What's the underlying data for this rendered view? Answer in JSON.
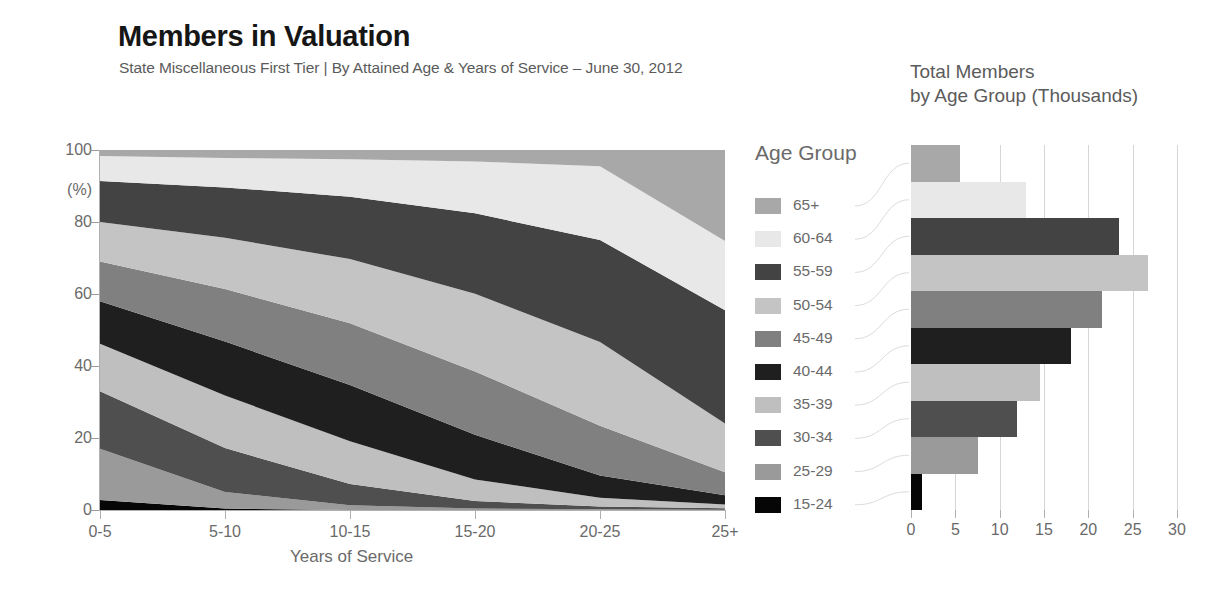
{
  "header": {
    "title": "Members in Valuation",
    "subtitle": "State Miscellaneous First Tier | By Attained Age & Years of Service – June 30, 2012",
    "right_title_line1": "Total Members",
    "right_title_line2": "by Age Group (Thousands)"
  },
  "legend": {
    "title": "Age Group",
    "items": [
      {
        "label": "65+",
        "color": "#a8a8a8"
      },
      {
        "label": "60-64",
        "color": "#e8e8e8"
      },
      {
        "label": "55-59",
        "color": "#434343"
      },
      {
        "label": "50-54",
        "color": "#c4c4c4"
      },
      {
        "label": "45-49",
        "color": "#808080"
      },
      {
        "label": "40-44",
        "color": "#1f1f1f"
      },
      {
        "label": "35-39",
        "color": "#bfbfbf"
      },
      {
        "label": "30-34",
        "color": "#4f4f4f"
      },
      {
        "label": "25-29",
        "color": "#9a9a9a"
      },
      {
        "label": "15-24",
        "color": "#060606"
      }
    ]
  },
  "chart_data": [
    {
      "type": "area",
      "id": "members-by-service-area",
      "title": "Members in Valuation",
      "subtitle": "State Miscellaneous First Tier | By Attained Age & Years of Service – June 30, 2012",
      "stacked": true,
      "normalized_percent": true,
      "xlabel": "Years of Service",
      "ylabel": "(%)",
      "ylim": [
        0,
        100
      ],
      "yticks": [
        0,
        20,
        40,
        60,
        80,
        100
      ],
      "grid": false,
      "legend_position": "right",
      "categories": [
        "0-5",
        "5-10",
        "10-15",
        "15-20",
        "20-25",
        "25+"
      ],
      "series": [
        {
          "name": "15-24",
          "color": "#060606",
          "values": [
            2.8,
            0.4,
            0.0,
            0.0,
            0.0,
            0.0
          ]
        },
        {
          "name": "25-29",
          "color": "#9a9a9a",
          "values": [
            14.2,
            4.6,
            1.3,
            0.4,
            0.2,
            0.1
          ]
        },
        {
          "name": "30-34",
          "color": "#4f4f4f",
          "values": [
            16.0,
            12.2,
            5.9,
            2.1,
            0.8,
            0.4
          ]
        },
        {
          "name": "35-39",
          "color": "#bfbfbf",
          "values": [
            13.2,
            14.6,
            11.9,
            6.0,
            2.4,
            1.0
          ]
        },
        {
          "name": "40-44",
          "color": "#1f1f1f",
          "values": [
            11.8,
            15.0,
            15.6,
            12.4,
            6.2,
            2.6
          ]
        },
        {
          "name": "45-49",
          "color": "#808080",
          "values": [
            11.0,
            14.6,
            17.2,
            17.6,
            13.8,
            6.4
          ]
        },
        {
          "name": "50-54",
          "color": "#c4c4c4",
          "values": [
            11.0,
            14.2,
            17.8,
            21.6,
            23.3,
            13.5
          ]
        },
        {
          "name": "55-59",
          "color": "#434343",
          "values": [
            11.4,
            14.0,
            17.3,
            22.3,
            28.3,
            31.5
          ]
        },
        {
          "name": "60-64",
          "color": "#e8e8e8",
          "values": [
            6.9,
            8.2,
            10.4,
            14.4,
            20.5,
            19.2
          ]
        },
        {
          "name": "65+",
          "color": "#a8a8a8",
          "values": [
            1.7,
            2.2,
            2.6,
            3.2,
            4.5,
            25.3
          ]
        }
      ]
    },
    {
      "type": "bar",
      "id": "total-members-by-age-group",
      "orientation": "horizontal",
      "title": "Total Members by Age Group (Thousands)",
      "xlabel": "",
      "ylabel": "",
      "xlim": [
        0,
        30
      ],
      "xticks": [
        0,
        5,
        10,
        15,
        20,
        25,
        30
      ],
      "grid": true,
      "categories": [
        "65+",
        "60-64",
        "55-59",
        "50-54",
        "45-49",
        "40-44",
        "35-39",
        "30-34",
        "25-29",
        "15-24"
      ],
      "values": [
        5.5,
        13.0,
        23.5,
        26.7,
        21.5,
        18.0,
        14.5,
        12.0,
        7.5,
        1.2
      ],
      "colors": [
        "#a8a8a8",
        "#e8e8e8",
        "#434343",
        "#c4c4c4",
        "#808080",
        "#1f1f1f",
        "#bfbfbf",
        "#4f4f4f",
        "#9a9a9a",
        "#060606"
      ]
    }
  ],
  "axes": {
    "area_y_ticks": [
      "0",
      "20",
      "40",
      "60",
      "80",
      "100"
    ],
    "area_y_unit": "(%)",
    "area_x_ticks": [
      "0-5",
      "5-10",
      "10-15",
      "15-20",
      "20-25",
      "25+"
    ],
    "area_x_title": "Years of Service",
    "bar_x_ticks": [
      "0",
      "5",
      "10",
      "15",
      "20",
      "25",
      "30"
    ]
  }
}
